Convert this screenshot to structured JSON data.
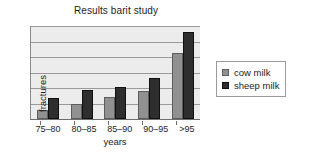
{
  "chart_data": {
    "type": "bar",
    "title": "Results barit study",
    "xlabel": "years",
    "ylabel": "fractures",
    "categories": [
      "75–80",
      "80–85",
      "85–90",
      "90–95",
      ">95"
    ],
    "series": [
      {
        "name": "cow milk",
        "color": "#919191",
        "values": [
          1.0,
          1.6,
          2.3,
          3.0,
          7.0
        ]
      },
      {
        "name": "sheep milk",
        "color": "#2e2e2e",
        "values": [
          2.2,
          3.1,
          3.4,
          4.4,
          9.3
        ]
      }
    ],
    "ylim": [
      0,
      10
    ],
    "yticks_labeled": false,
    "gridlines": 6,
    "grid": true,
    "legend_position": "right",
    "plot_background": "#ececec"
  }
}
